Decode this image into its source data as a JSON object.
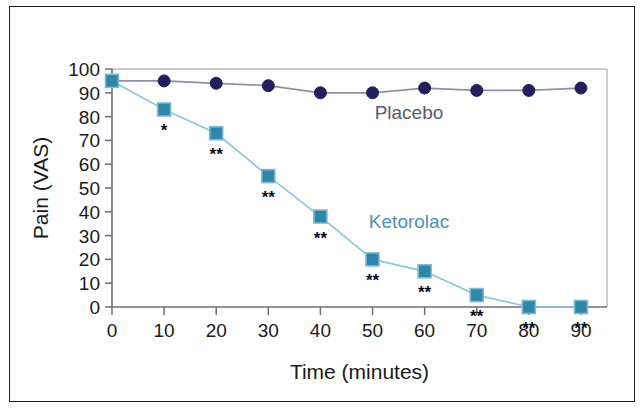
{
  "figure": {
    "background_color": "#ffffff",
    "border_color": "#231f20"
  },
  "chart_data": {
    "type": "line",
    "title": "",
    "xlabel": "Time (minutes)",
    "ylabel": "Pain (VAS)",
    "x": [
      0,
      10,
      20,
      30,
      40,
      50,
      60,
      70,
      80,
      90
    ],
    "xticklabels": [
      "0",
      "10",
      "20",
      "30",
      "40",
      "50",
      "60",
      "70",
      "80",
      "90"
    ],
    "yticklabels": [
      "0",
      "10",
      "20",
      "30",
      "40",
      "50",
      "60",
      "70",
      "80",
      "90",
      "100"
    ],
    "xlim": [
      0,
      95
    ],
    "ylim": [
      0,
      100
    ],
    "grid": false,
    "legend_position": "inline-annotation",
    "series": [
      {
        "name": "Placebo",
        "color": "#231f5c",
        "line_color": "#8f8fa8",
        "marker": "circle",
        "values": [
          95,
          95,
          94,
          93,
          90,
          90,
          92,
          91,
          91,
          92
        ],
        "significance": [
          "",
          "",
          "",
          "",
          "",
          "",
          "",
          "",
          "",
          ""
        ]
      },
      {
        "name": "Ketorolac",
        "color": "#2e86a8",
        "line_color": "#8fc6dc",
        "marker": "square",
        "values": [
          95,
          83,
          73,
          55,
          38,
          20,
          15,
          5,
          0,
          0
        ],
        "significance": [
          "",
          "*",
          "**",
          "**",
          "**",
          "**",
          "**",
          "**",
          "**",
          "**"
        ]
      }
    ],
    "annotations": [
      {
        "text": "Placebo",
        "x": 57,
        "y": 79,
        "color": "#5b5b6b"
      },
      {
        "text": "Ketorolac",
        "x": 57,
        "y": 33,
        "color": "#4a93b3"
      }
    ],
    "significance_note": {
      "single": "*",
      "double": "**"
    }
  }
}
